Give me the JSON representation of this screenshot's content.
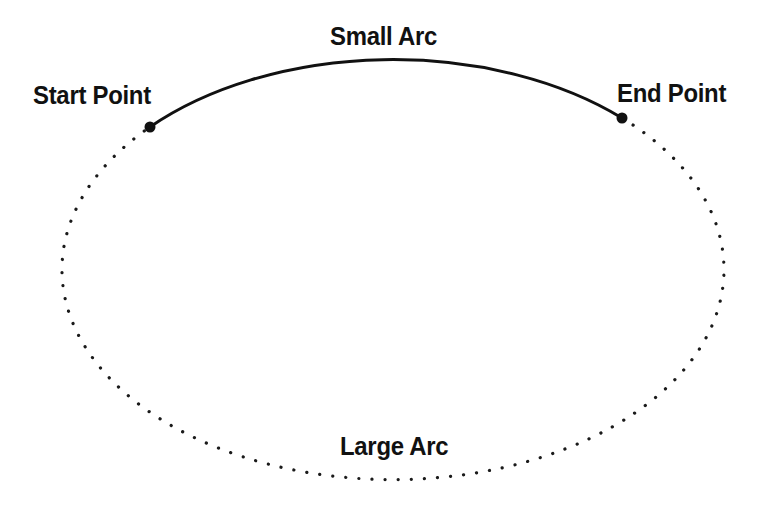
{
  "figure": {
    "background_color": "#ffffff",
    "stroke_color": "#111111",
    "width": 758,
    "height": 519
  },
  "labels": {
    "start_point": "Start Point",
    "end_point": "End Point",
    "small_arc": "Small Arc",
    "large_arc": "Large Arc"
  },
  "geometry": {
    "ellipse": {
      "center_x": 386,
      "center_y": 272,
      "radius_x": 331,
      "radius_y": 210
    },
    "start_point": {
      "x": 150,
      "y": 127
    },
    "end_point": {
      "x": 622,
      "y": 118
    },
    "small_arc_style": "solid",
    "large_arc_style": "dotted",
    "marker_radius": 5.5,
    "solid_stroke_width": 3,
    "dotted_stroke_width": 3.2,
    "dotted_dash_array": "0.1 13"
  }
}
